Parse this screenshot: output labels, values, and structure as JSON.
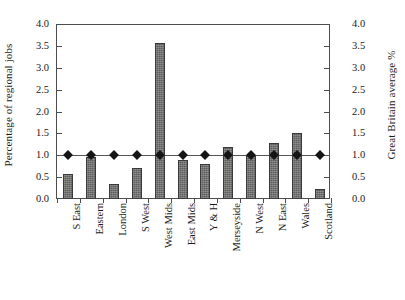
{
  "chart_data": {
    "type": "bar",
    "title": "",
    "subtitle": "",
    "xlabel": "",
    "ylabel": "Percentage of regional jobs",
    "y2label": "Great Britain average %",
    "ylim": [
      0.0,
      4.0
    ],
    "y2lim": [
      0.0,
      4.0
    ],
    "ytick_step": 0.5,
    "grid": false,
    "legend": "none",
    "categories": [
      "S East",
      "Eastern",
      "London",
      "S West",
      "West Mids",
      "East Mids",
      "Y & H",
      "Merseyside",
      "N West",
      "N East",
      "Wales",
      "Scotland"
    ],
    "ytick_labels": [
      "0.0",
      "0.5",
      "1.0",
      "1.5",
      "2.0",
      "2.5",
      "3.0",
      "3.5",
      "4.0"
    ],
    "ytick_values": [
      0.0,
      0.5,
      1.0,
      1.5,
      2.0,
      2.5,
      3.0,
      3.5,
      4.0
    ],
    "y2tick_labels": [
      "0.0",
      "0.5",
      "1.0",
      "1.5",
      "2.0",
      "2.5",
      "3.0",
      "3.5",
      "4.0"
    ],
    "series": [
      {
        "name": "Percentage of regional jobs",
        "type": "bar",
        "color": "#70706f",
        "edge_color": "#3a3a3a",
        "values": [
          0.57,
          0.95,
          0.34,
          0.71,
          3.57,
          0.9,
          0.81,
          1.19,
          0.99,
          1.28,
          1.51,
          0.23
        ]
      },
      {
        "name": "Great Britain average %",
        "type": "line-marker",
        "marker": "diamond",
        "color": "#151515",
        "line_color": "#555555",
        "values": [
          1.0,
          1.0,
          1.0,
          1.0,
          1.0,
          1.0,
          1.0,
          1.0,
          1.0,
          1.0,
          1.0,
          1.0
        ]
      }
    ]
  }
}
